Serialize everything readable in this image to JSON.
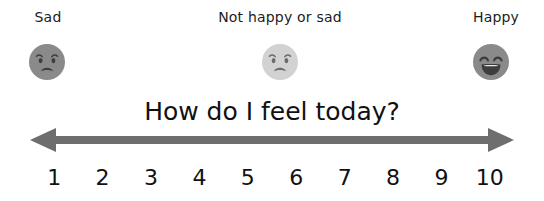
{
  "title": "How do I feel today?",
  "anchors": [
    {
      "label": "Sad",
      "face": "sad-face-icon",
      "position": "left"
    },
    {
      "label": "Not happy or sad",
      "face": "neutral-face-icon",
      "position": "middle"
    },
    {
      "label": "Happy",
      "face": "happy-face-icon",
      "position": "right"
    }
  ],
  "arrow": {
    "name": "double-headed-arrow",
    "direction": "both",
    "color": "#6e6e6e"
  },
  "scale": {
    "min": 1,
    "max": 10,
    "numbers": [
      "1",
      "2",
      "3",
      "4",
      "5",
      "6",
      "7",
      "8",
      "9",
      "10"
    ]
  },
  "colors": {
    "background": "#ffffff",
    "text": "#111111",
    "face_sad": "#8a8a8a",
    "face_neutral": "#d2d2d2",
    "face_happy": "#8a8a8a",
    "face_features": "#3d3d3d",
    "arrow": "#6e6e6e"
  }
}
